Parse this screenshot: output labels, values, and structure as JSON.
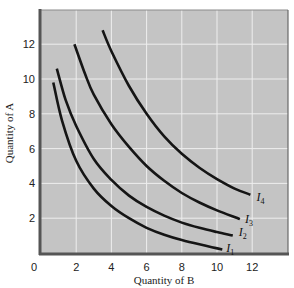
{
  "chart_data": {
    "type": "line",
    "title": "",
    "xlabel": "Quantity of B",
    "ylabel": "Quantity of A",
    "xlim": [
      0,
      14
    ],
    "ylim": [
      0,
      14
    ],
    "x_ticks": [
      0,
      2,
      4,
      6,
      8,
      10,
      12
    ],
    "y_ticks": [
      2,
      4,
      6,
      8,
      10,
      12
    ],
    "grid": true,
    "legend": "inline curve labels at right end of each curve",
    "series": [
      {
        "name": "I1",
        "label_main": "I",
        "label_sub": "1",
        "points": [
          [
            0.7,
            9.8
          ],
          [
            1.2,
            7.6
          ],
          [
            2.0,
            5.3
          ],
          [
            3.0,
            3.7
          ],
          [
            4.0,
            2.7
          ],
          [
            5.0,
            2.0
          ],
          [
            6.0,
            1.45
          ],
          [
            7.0,
            1.05
          ],
          [
            8.0,
            0.75
          ],
          [
            9.0,
            0.5
          ],
          [
            10.3,
            0.2
          ]
        ]
      },
      {
        "name": "I2",
        "label_main": "I",
        "label_sub": "2",
        "points": [
          [
            0.9,
            10.6
          ],
          [
            1.4,
            8.8
          ],
          [
            2.0,
            7.3
          ],
          [
            3.0,
            5.4
          ],
          [
            4.0,
            4.2
          ],
          [
            5.0,
            3.3
          ],
          [
            6.0,
            2.65
          ],
          [
            7.0,
            2.15
          ],
          [
            8.0,
            1.75
          ],
          [
            9.0,
            1.45
          ],
          [
            10.0,
            1.2
          ],
          [
            10.9,
            1.0
          ]
        ]
      },
      {
        "name": "I3",
        "label_main": "I",
        "label_sub": "3",
        "points": [
          [
            1.9,
            12.0
          ],
          [
            2.5,
            10.3
          ],
          [
            3.0,
            9.1
          ],
          [
            4.0,
            7.4
          ],
          [
            5.0,
            6.1
          ],
          [
            6.0,
            5.0
          ],
          [
            7.0,
            4.15
          ],
          [
            8.0,
            3.45
          ],
          [
            9.0,
            2.9
          ],
          [
            10.0,
            2.45
          ],
          [
            11.3,
            1.95
          ]
        ]
      },
      {
        "name": "I4",
        "label_main": "I",
        "label_sub": "4",
        "points": [
          [
            3.5,
            12.8
          ],
          [
            4.0,
            11.6
          ],
          [
            5.0,
            9.6
          ],
          [
            6.0,
            8.0
          ],
          [
            7.0,
            6.7
          ],
          [
            8.0,
            5.7
          ],
          [
            9.0,
            4.9
          ],
          [
            10.0,
            4.25
          ],
          [
            11.0,
            3.7
          ],
          [
            11.9,
            3.35
          ]
        ]
      }
    ]
  },
  "style": {
    "plot_bg": "#c4c4c4",
    "grid_color": "#eeeeee",
    "curve_color": "#151515",
    "border_color": "#555555"
  }
}
